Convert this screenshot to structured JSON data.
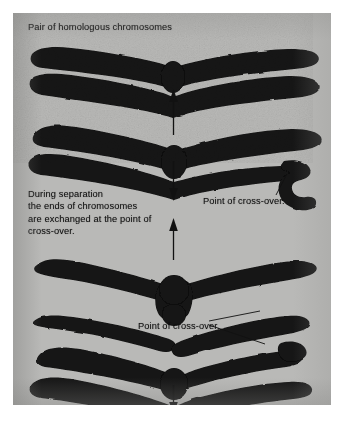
{
  "figure": {
    "kind": "biology-diagram",
    "background_color": "#b9b9b7",
    "ink_color": "#121212",
    "page_border_color": "#ffffff"
  },
  "labels": {
    "title": "Pair of homologous chromosomes",
    "separation": "During separation\nthe ends of chromosomes\nare exchanged at the point of\ncross-over.",
    "cross_over_upper": "Point of cross-over.",
    "cross_over_lower": "Point of cross-over."
  },
  "panels": [
    {
      "id": "panel-1",
      "name": "homologous-pair-paired",
      "description": "Two homologous chromosomes lying together, touching at a central knot (chiasma)."
    },
    {
      "id": "panel-2",
      "name": "homologous-pair-crossed",
      "description": "The pair crossed at the centre; the right-hand arm shows a hooked exchanged end."
    },
    {
      "id": "panel-3",
      "name": "homologous-pair-separating",
      "description": "The pair splayed open into an X, arms separating from the cross-over point."
    },
    {
      "id": "panel-4",
      "name": "homologous-pair-exchanged",
      "description": "The pair after exchange, with a hooked tip on the upper right arm."
    }
  ],
  "arrows": [
    {
      "id": "arrow-1",
      "name": "arrow-up-panel1",
      "direction": "up"
    },
    {
      "id": "arrow-2",
      "name": "arrow-down-panel2",
      "direction": "down"
    },
    {
      "id": "arrow-3",
      "name": "arrow-up-panel3",
      "direction": "up"
    },
    {
      "id": "arrow-4",
      "name": "arrow-down-panel4",
      "direction": "down"
    }
  ],
  "leader_lines": [
    {
      "id": "leader-1",
      "name": "leader-cross-over-upper",
      "from": "cross-over-label-upper",
      "to": "panel-2 hooked end"
    },
    {
      "id": "leader-2",
      "name": "leader-cross-over-lower-a",
      "from": "cross-over-label-lower",
      "to": "panel-3 lower right tip"
    },
    {
      "id": "leader-3",
      "name": "leader-cross-over-lower-b",
      "from": "cross-over-label-lower",
      "to": "panel-4 hooked tip"
    }
  ]
}
